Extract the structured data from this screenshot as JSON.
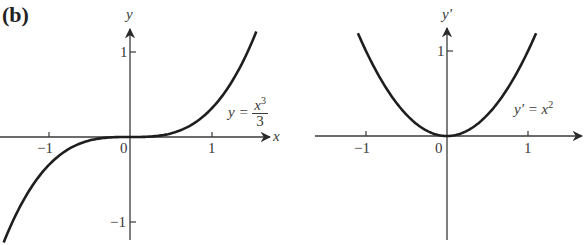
{
  "figure": {
    "panel_label": "(b)",
    "left_plot": {
      "y_axis_label": "y",
      "x_axis_label": "x",
      "x_ticks": [
        "−1",
        "0",
        "1"
      ],
      "y_ticks": [
        "1",
        "−1"
      ],
      "equation": {
        "lhs": "y =",
        "num": "x",
        "num_exp": "3",
        "den": "3"
      }
    },
    "right_plot": {
      "y_axis_label": "y′",
      "x_ticks": [
        "−1",
        "0",
        "1"
      ],
      "y_ticks": [
        "1"
      ],
      "equation": {
        "lhs": "y′ = x",
        "exp": "2"
      }
    }
  },
  "chart_data": [
    {
      "type": "line",
      "title": "",
      "xlabel": "x",
      "ylabel": "y",
      "annotation": "y = x^3/3",
      "xlim": [
        -1.6,
        1.75
      ],
      "ylim": [
        -1.3,
        1.3
      ],
      "grid": false,
      "x_ticks": [
        -1,
        0,
        1
      ],
      "y_ticks": [
        -1,
        1
      ],
      "series": [
        {
          "name": "y = x^3/3",
          "x": [
            -1.55,
            -1.25,
            -1.0,
            -0.75,
            -0.5,
            -0.25,
            0,
            0.25,
            0.5,
            0.75,
            1.0,
            1.25,
            1.55
          ],
          "y": [
            -1.241,
            -0.651,
            -0.333,
            -0.141,
            -0.042,
            -0.005,
            0,
            0.005,
            0.042,
            0.141,
            0.333,
            0.651,
            1.241
          ]
        }
      ]
    },
    {
      "type": "line",
      "title": "",
      "xlabel": "x",
      "ylabel": "y′",
      "annotation": "y′ = x^2",
      "xlim": [
        -1.6,
        1.7
      ],
      "ylim": [
        -1.3,
        1.3
      ],
      "grid": false,
      "x_ticks": [
        -1,
        0,
        1
      ],
      "y_ticks": [
        1
      ],
      "series": [
        {
          "name": "y′ = x^2",
          "x": [
            -1.1,
            -1.0,
            -0.75,
            -0.5,
            -0.25,
            0,
            0.25,
            0.5,
            0.75,
            1.0,
            1.1
          ],
          "y": [
            1.21,
            1.0,
            0.5625,
            0.25,
            0.0625,
            0,
            0.0625,
            0.25,
            0.5625,
            1.0,
            1.21
          ]
        }
      ]
    }
  ]
}
